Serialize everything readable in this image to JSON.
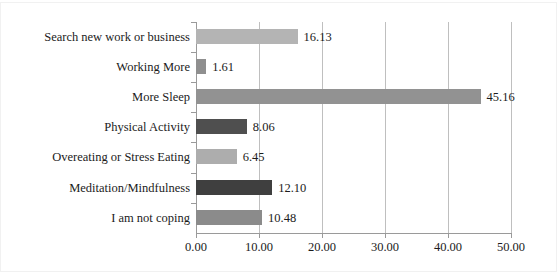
{
  "chart_data": {
    "type": "bar",
    "orientation": "horizontal",
    "title": "",
    "xlabel": "",
    "ylabel": "",
    "xlim": [
      0,
      50
    ],
    "grid": true,
    "legend": false,
    "xticks": [
      "0.00",
      "10.00",
      "20.00",
      "30.00",
      "40.00",
      "50.00"
    ],
    "xtick_values": [
      0,
      10,
      20,
      30,
      40,
      50
    ],
    "categories": [
      "Search new work or business",
      "Working More",
      "More Sleep",
      "Physical Activity",
      "Overeating or Stress Eating",
      "Meditation/Mindfulness",
      "I am not coping"
    ],
    "values": [
      16.13,
      1.61,
      45.16,
      8.06,
      6.45,
      12.1,
      10.48
    ],
    "data_labels": [
      "16.13",
      "1.61",
      "45.16",
      "8.06",
      "6.45",
      "12.10",
      "10.48"
    ],
    "bar_colors": [
      "#b4b4b4",
      "#8f8f8f",
      "#929292",
      "#4f4f4f",
      "#adadad",
      "#3f3f3f",
      "#8b8b8b"
    ],
    "bars": [
      {
        "category": "Search new work or business",
        "value": 16.13,
        "label": "16.13",
        "color": "#b4b4b4"
      },
      {
        "category": "Working More",
        "value": 1.61,
        "label": "1.61",
        "color": "#8f8f8f"
      },
      {
        "category": "More Sleep",
        "value": 45.16,
        "label": "45.16",
        "color": "#929292"
      },
      {
        "category": "Physical Activity",
        "value": 8.06,
        "label": "8.06",
        "color": "#4f4f4f"
      },
      {
        "category": "Overeating or Stress Eating",
        "value": 6.45,
        "label": "6.45",
        "color": "#adadad"
      },
      {
        "category": "Meditation/Mindfulness",
        "value": 12.1,
        "label": "12.10",
        "color": "#3f3f3f"
      },
      {
        "category": "I am not coping",
        "value": 10.48,
        "label": "10.48",
        "color": "#8b8b8b"
      }
    ]
  },
  "style": {
    "grid_color": "#bfbfbf",
    "axis_color": "#9a9a9a",
    "text_color": "#1b1b1b",
    "background": "#ffffff"
  }
}
